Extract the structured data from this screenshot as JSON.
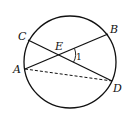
{
  "diagram": {
    "type": "circle-geometry",
    "circle": {
      "cx": 70,
      "cy": 62,
      "r": 46
    },
    "points": {
      "A": {
        "label": "A",
        "x": 25,
        "y": 69
      },
      "B": {
        "label": "B",
        "x": 108,
        "y": 34
      },
      "C": {
        "label": "C",
        "x": 28,
        "y": 40
      },
      "D": {
        "label": "D",
        "x": 112,
        "y": 81
      },
      "E": {
        "label": "E",
        "x": 59,
        "y": 55
      }
    },
    "segments": [
      {
        "from": "A",
        "to": "B",
        "style": "solid"
      },
      {
        "from": "C",
        "to": "D",
        "style": "solid"
      },
      {
        "from": "A",
        "to": "D",
        "style": "dashed"
      }
    ],
    "angle_marks": [
      {
        "label": "1",
        "vertex": "E",
        "between": [
          "B",
          "D"
        ]
      }
    ],
    "stroke_color": "#111111"
  }
}
